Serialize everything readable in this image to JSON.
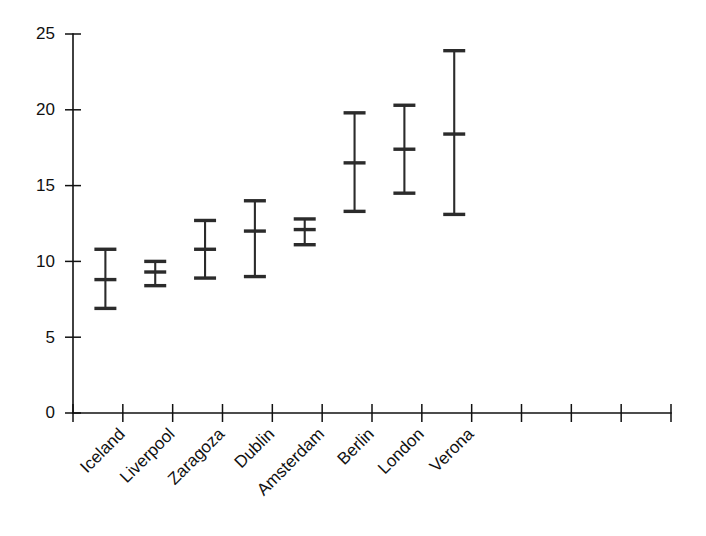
{
  "chart_data": {
    "type": "errorbar",
    "title": "",
    "subtitle": "",
    "xlabel": "",
    "ylabel": "",
    "categories": [
      "Iceland",
      "Liverpool",
      "Zaragoza",
      "Dublin",
      "Amsterdam",
      "Berlin",
      "London",
      "Verona"
    ],
    "values": [
      8.8,
      9.3,
      10.8,
      12.0,
      12.1,
      16.5,
      17.4,
      18.4
    ],
    "error_low": [
      6.9,
      8.4,
      8.9,
      9.0,
      11.1,
      13.3,
      14.5,
      13.1
    ],
    "error_high": [
      10.8,
      10.0,
      12.7,
      14.0,
      12.8,
      19.8,
      20.3,
      23.9
    ],
    "series": [
      {
        "name": "mean with range",
        "points": [
          {
            "category": "Iceland",
            "value": 8.8,
            "low": 6.9,
            "high": 10.8
          },
          {
            "category": "Liverpool",
            "value": 9.3,
            "low": 8.4,
            "high": 10.0
          },
          {
            "category": "Zaragoza",
            "value": 10.8,
            "low": 8.9,
            "high": 12.7
          },
          {
            "category": "Dublin",
            "value": 12.0,
            "low": 9.0,
            "high": 14.0
          },
          {
            "category": "Amsterdam",
            "value": 12.1,
            "low": 11.1,
            "high": 12.8
          },
          {
            "category": "Berlin",
            "value": 16.5,
            "low": 13.3,
            "high": 19.8
          },
          {
            "category": "London",
            "value": 17.4,
            "low": 14.5,
            "high": 20.3
          },
          {
            "category": "Verona",
            "value": 18.4,
            "low": 13.1,
            "high": 23.9
          }
        ]
      }
    ],
    "ylim": [
      0,
      25
    ],
    "yticks": [
      0,
      5,
      10,
      15,
      20,
      25
    ],
    "ytick_labels": [
      "0",
      "5",
      "10",
      "15",
      "20",
      "25"
    ],
    "xtick_count": 12,
    "grid": false,
    "legend": false,
    "legend_position": "none",
    "xtick_label_rotation": -45,
    "colors": {
      "marker": "#2b2b2b",
      "axis": "#111111",
      "background": "#ffffff"
    }
  },
  "axis": {
    "y_labels": [
      "25",
      "20",
      "15",
      "10",
      "5",
      "0"
    ]
  },
  "x_labels": {
    "0": "Iceland",
    "1": "Liverpool",
    "2": "Zaragoza",
    "3": "Dublin",
    "4": "Amsterdam",
    "5": "Berlin",
    "6": "London",
    "7": "Verona"
  }
}
